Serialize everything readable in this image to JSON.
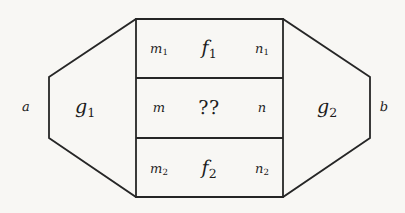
{
  "figure": {
    "kind": "math-diagram",
    "colors": {
      "background": "#f8f7f4",
      "stroke": "#262626",
      "text": "#1d1d1d"
    },
    "outer_labels": {
      "left": "a",
      "right": "b"
    },
    "regions": {
      "left": {
        "base": "g",
        "sub": "1"
      },
      "right": {
        "base": "g",
        "sub": "2"
      }
    },
    "rows": [
      {
        "id": "row-top",
        "left": {
          "base": "m",
          "sub": "1"
        },
        "center": {
          "base": "f",
          "sub": "1"
        },
        "right": {
          "base": "n",
          "sub": "1"
        }
      },
      {
        "id": "row-middle",
        "left": {
          "base": "m",
          "sub": ""
        },
        "center": {
          "base": "??",
          "sub": ""
        },
        "right": {
          "base": "n",
          "sub": ""
        }
      },
      {
        "id": "row-bottom",
        "left": {
          "base": "m",
          "sub": "2"
        },
        "center": {
          "base": "f",
          "sub": "2"
        },
        "right": {
          "base": "n",
          "sub": "2"
        }
      }
    ],
    "geometry": {
      "hexagon_points": "49,77 136,19 283,19 370,77 370,138 283,197 136,197 49,138",
      "rect": {
        "x": 136,
        "y": 19,
        "width": 147,
        "height": 178
      },
      "divider_y": [
        78,
        138
      ]
    }
  }
}
